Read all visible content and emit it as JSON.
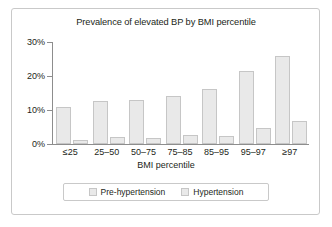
{
  "figure": {
    "frame_border_color": "#c9c9c9",
    "background": "#ffffff"
  },
  "chart_data": {
    "type": "bar",
    "title": "Prevalence of elevated BP by BMI percentile",
    "xlabel": "BMI percentile",
    "ylabel": "",
    "categories": [
      "≤25",
      "25–50",
      "50–75",
      "75–85",
      "85–95",
      "95–97",
      "≥97"
    ],
    "series": [
      {
        "name": "Pre-hypertension",
        "color": "#e9e9e9",
        "border_color": "#c6c6c6",
        "values": [
          10.8,
          12.6,
          12.9,
          14.1,
          16.0,
          21.4,
          26.0
        ]
      },
      {
        "name": "Hypertension",
        "color": "#e9e9e9",
        "border_color": "#c6c6c6",
        "values": [
          1.0,
          2.0,
          1.5,
          2.5,
          2.2,
          4.6,
          6.8
        ]
      }
    ],
    "ylim": [
      0,
      30
    ],
    "yticks": [
      0,
      10,
      20,
      30
    ],
    "ytick_labels": [
      "0%",
      "10%",
      "20%",
      "30%"
    ],
    "grid": false,
    "legend_position": "bottom",
    "axis_color": "#8d8d8d"
  }
}
